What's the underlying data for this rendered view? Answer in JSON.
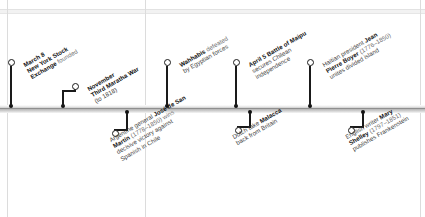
{
  "page": {
    "rail_color": "#b4b4b4",
    "ink_color": "#1a1a1a"
  },
  "ghost_labels": {
    "a": "",
    "b": "",
    "c": ""
  },
  "events": [
    {
      "id": "nyse-founded",
      "side": "above",
      "tick_x": 11,
      "knob_x": 11,
      "knob_y": 62,
      "lines": [
        {
          "text": "March 8",
          "bold": true
        },
        {
          "text": "New York Stock",
          "bold": true
        },
        {
          "text": "Exchange ",
          "bold": true,
          "tail": "founded"
        }
      ],
      "label_x": 22,
      "label_y": 62
    },
    {
      "id": "third-maratha-war",
      "side": "above",
      "tick_x": 63,
      "knob_x": 75,
      "knob_y": 86,
      "lines": [
        {
          "text": "November",
          "bold": true
        },
        {
          "text": "Third Maratha War",
          "bold": true
        },
        {
          "text": "(to 1818)",
          "bold": false
        }
      ],
      "label_x": 86,
      "label_y": 86
    },
    {
      "id": "wahhabis-defeated",
      "side": "above",
      "tick_x": 167,
      "knob_x": 167,
      "knob_y": 62,
      "lines": [
        {
          "text": "Wahhabis ",
          "bold": true,
          "tail": "defeated"
        },
        {
          "text": "by Egyptian forces",
          "bold": false
        }
      ],
      "label_x": 178,
      "label_y": 62
    },
    {
      "id": "battle-of-maipu",
      "side": "above",
      "tick_x": 236,
      "knob_x": 236,
      "knob_y": 62,
      "lines": [
        {
          "text": "April 5 Battle of Maipu",
          "bold": true
        },
        {
          "text": "secures Chilean",
          "bold": false
        },
        {
          "text": "independence",
          "bold": false
        }
      ],
      "label_x": 247,
      "label_y": 62
    },
    {
      "id": "jean-pierre-boyer",
      "side": "above",
      "tick_x": 310,
      "knob_x": 310,
      "knob_y": 62,
      "lines": [
        {
          "text": "Haitian president ",
          "bold": false,
          "tail_bold": "Jean"
        },
        {
          "text": "Pierre Boyer",
          "bold": true,
          "tail": " (1776–1850)"
        },
        {
          "text": "unites divided island",
          "bold": false
        }
      ],
      "label_x": 321,
      "label_y": 62
    },
    {
      "id": "san-martin-chile",
      "side": "below",
      "tick_x": 127,
      "knob_x": 115,
      "knob_y": 133,
      "lines": [
        {
          "text": "Argentine general ",
          "bold": false,
          "tail_bold": "José de San"
        },
        {
          "text": "Martín",
          "bold": true,
          "tail": " (1778–1850) wins"
        },
        {
          "text": "decisive victory against",
          "bold": false
        },
        {
          "text": "Spanish in Chile",
          "bold": false
        }
      ],
      "label_x": 108,
      "label_y": 137
    },
    {
      "id": "dutch-take-malacca",
      "side": "below",
      "tick_x": 250,
      "knob_x": 238,
      "knob_y": 130,
      "lines": [
        {
          "text": "Dutch take ",
          "bold": false,
          "tail_bold": "Malacca"
        },
        {
          "text": "back from Britain",
          "bold": false
        }
      ],
      "label_x": 231,
      "label_y": 134
    },
    {
      "id": "mary-shelley-frankenstein",
      "side": "below",
      "tick_x": 363,
      "knob_x": 351,
      "knob_y": 130,
      "lines": [
        {
          "text": "English writer ",
          "bold": false,
          "tail_bold": "Mary"
        },
        {
          "text": "Shelley",
          "bold": true,
          "tail": " (1797–1851)"
        },
        {
          "text": "publishes Frankenstein",
          "bold": false
        }
      ],
      "label_x": 344,
      "label_y": 134
    }
  ],
  "gridlines": {
    "vertical_x": [
      7,
      145,
      420
    ],
    "horizontal_y": [
      9,
      13
    ]
  }
}
